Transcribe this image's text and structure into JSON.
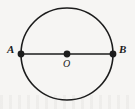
{
  "figure": {
    "kind": "geometry-diagram",
    "background_color": "#f6f5f3",
    "stroke_color": "#1c1c1c",
    "canvas": {
      "width": 135,
      "height": 109
    }
  },
  "circle": {
    "name": "circle-O",
    "center_x": 67,
    "center_y": 54,
    "radius": 46,
    "stroke_width": 1.6,
    "fill": "none"
  },
  "diameter": {
    "name": "segment-AB",
    "x1": 21,
    "y1": 54,
    "x2": 113,
    "y2": 54,
    "stroke_width": 1.6
  },
  "points": [
    {
      "id": "A",
      "label": "A",
      "cx": 21,
      "cy": 54,
      "r": 3.4,
      "label_x": 7,
      "label_y": 44
    },
    {
      "id": "O",
      "label": "O",
      "cx": 67,
      "cy": 54,
      "r": 3.4,
      "label_x": 63,
      "label_y": 58
    },
    {
      "id": "B",
      "label": "B",
      "cx": 113,
      "cy": 54,
      "r": 3.4,
      "label_x": 119,
      "label_y": 44
    }
  ],
  "labels": {
    "a": "A",
    "o": "O",
    "b": "B"
  }
}
